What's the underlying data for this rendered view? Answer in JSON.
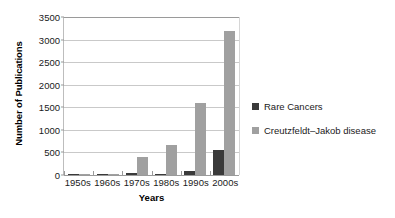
{
  "chart_data": {
    "type": "bar",
    "title": "",
    "xlabel": "Years",
    "ylabel": "Number of Publications",
    "categories": [
      "1950s",
      "1960s",
      "1970s",
      "1980s",
      "1990s",
      "2000s"
    ],
    "series": [
      {
        "name": "Rare Cancers",
        "color": "#3a3a3a",
        "values": [
          5,
          8,
          35,
          30,
          95,
          560
        ]
      },
      {
        "name": "Creutzfeldt–Jakob disease",
        "color": "#a0a0a0",
        "values": [
          10,
          30,
          400,
          660,
          1590,
          3190
        ]
      }
    ],
    "ylim": [
      0,
      3500
    ],
    "yticks": [
      0,
      500,
      1000,
      1500,
      2000,
      2500,
      3000,
      3500
    ],
    "ytick_labels": [
      "0",
      "500",
      "1000",
      "1500",
      "2000",
      "2500",
      "3000",
      "3500"
    ],
    "grid": true,
    "legend_position": "right"
  }
}
